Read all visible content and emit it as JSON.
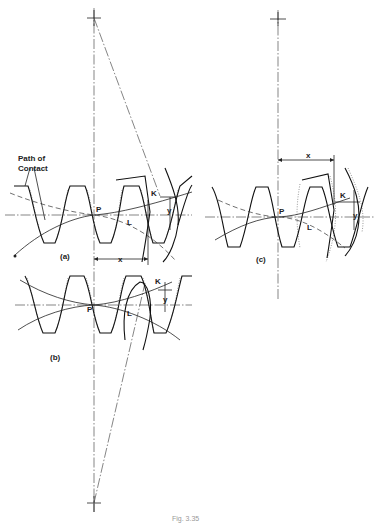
{
  "figure": {
    "caption": "Fig. 3.35",
    "panels": [
      {
        "id": "a",
        "label": "(a)"
      },
      {
        "id": "b",
        "label": "(b)"
      },
      {
        "id": "c",
        "label": "(c)"
      }
    ],
    "annotations": {
      "path_of_contact_line1": "Path of",
      "path_of_contact_line2": "Contact",
      "pitch_point": "P",
      "point_k": "K",
      "point_l": "L",
      "dim_x": "x",
      "dim_y": "y"
    }
  }
}
